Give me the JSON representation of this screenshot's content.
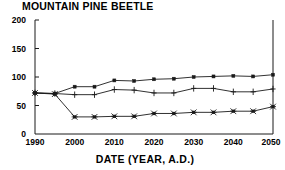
{
  "chart_data": {
    "type": "line",
    "title": "MOUNTAIN PINE BEETLE",
    "xlabel": "DATE (YEAR, A.D.)",
    "ylabel": "",
    "xlim": [
      1990,
      2050
    ],
    "ylim": [
      0,
      200
    ],
    "grid": false,
    "legend": "none",
    "xticks": [
      "1990",
      "2000",
      "2010",
      "2020",
      "2030",
      "2040",
      "2050"
    ],
    "xtick_values": [
      1990,
      2000,
      2010,
      2020,
      2030,
      2040,
      2050
    ],
    "yticks": [
      "0",
      "50",
      "100",
      "150",
      "200"
    ],
    "ytick_values": [
      0,
      50,
      100,
      150,
      200
    ],
    "x": [
      1990,
      1995,
      2000,
      2005,
      2010,
      2015,
      2020,
      2025,
      2030,
      2035,
      2040,
      2045,
      2050
    ],
    "series": [
      {
        "name": "upper",
        "marker": "square",
        "color": "#1a1a1a",
        "values": [
          72,
          71,
          83,
          83,
          94,
          93,
          96,
          97,
          100,
          101,
          102,
          101,
          104
        ]
      },
      {
        "name": "middle",
        "marker": "plus",
        "color": "#1a1a1a",
        "values": [
          72,
          71,
          69,
          69,
          78,
          77,
          72,
          72,
          80,
          80,
          74,
          74,
          79
        ]
      },
      {
        "name": "lower",
        "marker": "asterisk",
        "color": "#1a1a1a",
        "values": [
          72,
          70,
          30,
          30,
          31,
          31,
          36,
          36,
          38,
          38,
          40,
          40,
          48
        ]
      }
    ]
  },
  "axis": {
    "tick_0": "0",
    "tick_50": "50",
    "tick_100": "100",
    "tick_150": "150",
    "tick_200": "200",
    "x_1990": "1990",
    "x_2000": "2000",
    "x_2010": "2010",
    "x_2020": "2020",
    "x_2030": "2030",
    "x_2040": "2040",
    "x_2050": "2050"
  },
  "colors": {
    "ink": "#1a1a1a",
    "background": "#ffffff"
  }
}
